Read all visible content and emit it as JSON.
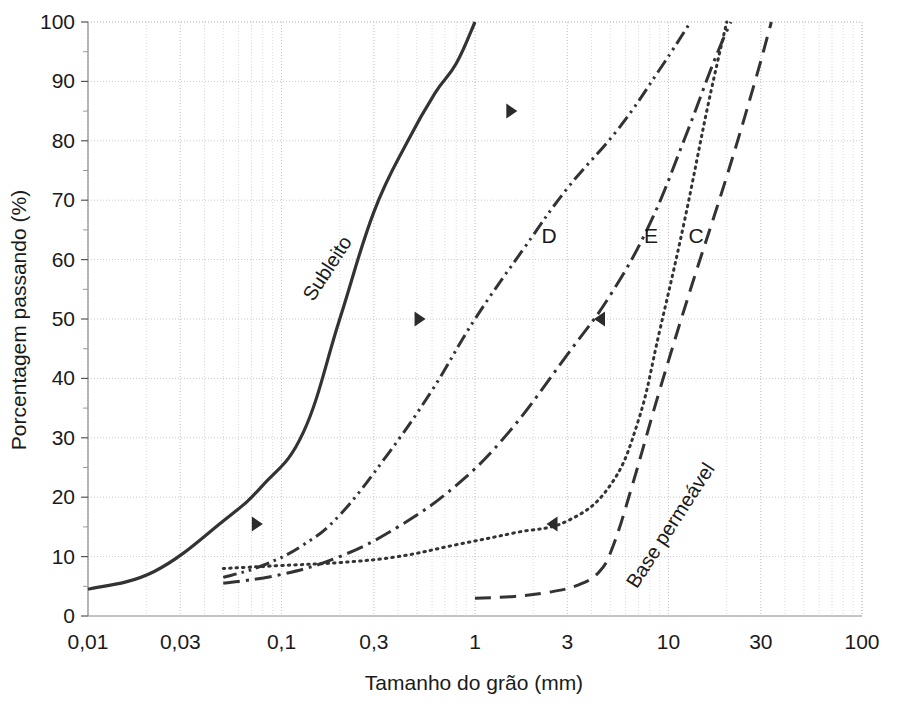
{
  "figure": {
    "background": "#ffffff",
    "ink": "#333333",
    "grid_major_color": "#c9c9cf",
    "grid_minor_color": "#d8d8de",
    "frame_color": "#8a8a92"
  },
  "chart_data": {
    "type": "line",
    "title": "",
    "xlabel": "Tamanho do grão (mm)",
    "ylabel": "Porcentagem passando (%)",
    "xscale": "log",
    "xlim": [
      0.01,
      100
    ],
    "ylim": [
      0,
      100
    ],
    "xticks": [
      "0,01",
      "0,03",
      "0,1",
      "0,3",
      "1",
      "3",
      "10",
      "30",
      "100"
    ],
    "xtick_values": [
      0.01,
      0.03,
      0.1,
      0.3,
      1,
      3,
      10,
      30,
      100
    ],
    "yticks": [
      "0",
      "10",
      "20",
      "30",
      "40",
      "50",
      "60",
      "70",
      "80",
      "90",
      "100"
    ],
    "ytick_values": [
      0,
      10,
      20,
      30,
      40,
      50,
      60,
      70,
      80,
      90,
      100
    ],
    "grid": true,
    "legend_position": "inline-labels",
    "series": [
      {
        "name": "Subleito",
        "label": "Subleito",
        "style": "solid",
        "x": [
          0.01,
          0.022,
          0.05,
          0.08,
          0.13,
          0.2,
          0.3,
          0.45,
          0.62,
          0.8,
          1.0
        ],
        "values": [
          4.5,
          7.5,
          16,
          22,
          31,
          50,
          68,
          80,
          88,
          93,
          100
        ]
      },
      {
        "name": "D",
        "label": "D",
        "style": "dash-dot-dot",
        "x": [
          0.05,
          0.08,
          0.13,
          0.2,
          0.35,
          0.6,
          1.0,
          1.8,
          3.0,
          5.5,
          9.0,
          13.0
        ],
        "values": [
          6.5,
          8.5,
          12,
          17,
          27,
          38,
          50,
          62,
          72,
          82,
          92,
          100
        ]
      },
      {
        "name": "E",
        "label": "E",
        "style": "dash-dot",
        "x": [
          0.05,
          0.1,
          0.2,
          0.4,
          0.8,
          1.5,
          3.0,
          5.0,
          8.0,
          12.0,
          17.0,
          21.0
        ],
        "values": [
          5.5,
          7,
          10,
          15,
          22,
          31,
          44,
          54,
          66,
          80,
          93,
          100
        ]
      },
      {
        "name": "C",
        "label": "C",
        "style": "dotted",
        "x": [
          0.05,
          0.1,
          0.2,
          0.4,
          0.8,
          1.6,
          3.0,
          5.0,
          7.0,
          9.0,
          12.0,
          16.0,
          20.0
        ],
        "values": [
          8,
          8.5,
          9,
          10,
          12,
          14,
          16,
          22,
          33,
          48,
          66,
          86,
          100
        ]
      },
      {
        "name": "Base permeável",
        "label": "Base permeável",
        "style": "dashed",
        "x": [
          1.0,
          1.6,
          2.4,
          3.4,
          4.4,
          5.2,
          6.5,
          9.0,
          13.0,
          20.0,
          28.0,
          34.0
        ],
        "values": [
          3,
          3.3,
          4,
          5.2,
          7.5,
          12,
          22,
          38,
          55,
          74,
          90,
          100
        ]
      }
    ],
    "annotations": [
      {
        "name": "arrow-marker-1",
        "direction": "right",
        "x": 1.55,
        "y": 85
      },
      {
        "name": "arrow-marker-2",
        "direction": "right",
        "x": 0.52,
        "y": 50
      },
      {
        "name": "arrow-marker-3",
        "direction": "left",
        "x": 4.4,
        "y": 50
      },
      {
        "name": "arrow-marker-4",
        "direction": "right",
        "x": 0.075,
        "y": 15.5
      },
      {
        "name": "arrow-marker-5",
        "direction": "left",
        "x": 2.5,
        "y": 15.5
      }
    ],
    "inline_labels": [
      {
        "name": "label-subleito",
        "text": "Subleito",
        "x_px": 333,
        "y_px": 272,
        "rotate": -57
      },
      {
        "name": "label-base-permeavel",
        "text": "Base permeável",
        "x_px": 676,
        "y_px": 529,
        "rotate": -57
      },
      {
        "name": "label-d",
        "text": "D",
        "x_px": 549,
        "y_px": 243,
        "rotate": 0
      },
      {
        "name": "label-e",
        "text": "E",
        "x_px": 651,
        "y_px": 243,
        "rotate": 0
      },
      {
        "name": "label-c",
        "text": "C",
        "x_px": 696,
        "y_px": 243,
        "rotate": 0
      }
    ]
  }
}
